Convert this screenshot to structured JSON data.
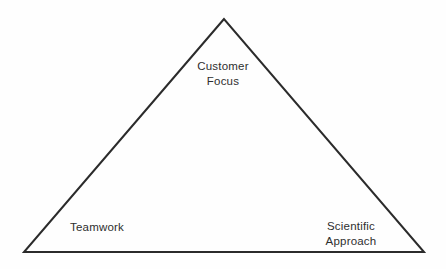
{
  "diagram": {
    "shape": "triangle",
    "stroke_color": "#2b2b2b",
    "background_color": "#fefefe",
    "text_color": "#2e2e2e",
    "triangle_points": "224,19 24,252 424,252",
    "labels": {
      "top": "Customer Focus",
      "bottom_left": "Teamwork",
      "bottom_right": "Scientific Approach"
    }
  }
}
